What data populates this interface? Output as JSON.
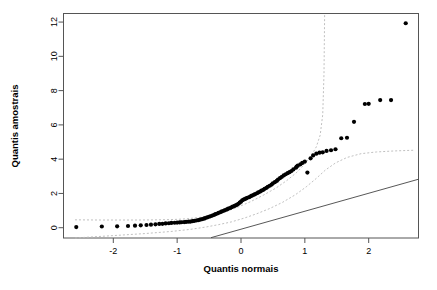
{
  "chart_data": {
    "type": "scatter",
    "title": "",
    "xlabel": "Quantis normais",
    "ylabel": "Quantis amostrais",
    "xlim": [
      -2.78,
      2.78
    ],
    "ylim": [
      -0.6,
      12.5
    ],
    "xticks": [
      -2,
      -1,
      0,
      1,
      2
    ],
    "xticklabels": [
      "-2",
      "-1",
      "0",
      "1",
      "2"
    ],
    "yticks": [
      0,
      2,
      4,
      6,
      8,
      10,
      12
    ],
    "yticklabels": [
      "0",
      "2",
      "4",
      "6",
      "8",
      "10",
      "12"
    ],
    "grid": false,
    "legend": "none",
    "series": [
      {
        "name": "Quantis amostrais (pontos)",
        "marker": "filled-circle",
        "color": "#000000",
        "points": [
          [
            -2.58,
            0.04
          ],
          [
            -2.18,
            0.07
          ],
          [
            -1.94,
            0.08
          ],
          [
            -1.77,
            0.1
          ],
          [
            -1.66,
            0.12
          ],
          [
            -1.57,
            0.14
          ],
          [
            -1.48,
            0.16
          ],
          [
            -1.41,
            0.18
          ],
          [
            -1.34,
            0.2
          ],
          [
            -1.28,
            0.22
          ],
          [
            -1.23,
            0.23
          ],
          [
            -1.18,
            0.25
          ],
          [
            -1.13,
            0.26
          ],
          [
            -1.09,
            0.28
          ],
          [
            -1.04,
            0.29
          ],
          [
            -1.0,
            0.3
          ],
          [
            -0.96,
            0.31
          ],
          [
            -0.93,
            0.32
          ],
          [
            -0.89,
            0.33
          ],
          [
            -0.86,
            0.34
          ],
          [
            -0.82,
            0.35
          ],
          [
            -0.79,
            0.36
          ],
          [
            -0.76,
            0.38
          ],
          [
            -0.73,
            0.4
          ],
          [
            -0.7,
            0.42
          ],
          [
            -0.67,
            0.44
          ],
          [
            -0.64,
            0.47
          ],
          [
            -0.61,
            0.5
          ],
          [
            -0.58,
            0.53
          ],
          [
            -0.56,
            0.56
          ],
          [
            -0.53,
            0.6
          ],
          [
            -0.5,
            0.64
          ],
          [
            -0.48,
            0.67
          ],
          [
            -0.45,
            0.71
          ],
          [
            -0.42,
            0.75
          ],
          [
            -0.4,
            0.79
          ],
          [
            -0.37,
            0.83
          ],
          [
            -0.35,
            0.87
          ],
          [
            -0.32,
            0.91
          ],
          [
            -0.3,
            0.95
          ],
          [
            -0.27,
            0.99
          ],
          [
            -0.25,
            1.03
          ],
          [
            -0.22,
            1.07
          ],
          [
            -0.2,
            1.11
          ],
          [
            -0.17,
            1.15
          ],
          [
            -0.15,
            1.19
          ],
          [
            -0.13,
            1.23
          ],
          [
            -0.1,
            1.27
          ],
          [
            -0.08,
            1.31
          ],
          [
            -0.06,
            1.35
          ],
          [
            -0.04,
            1.4
          ],
          [
            -0.02,
            1.46
          ],
          [
            0.0,
            1.52
          ],
          [
            0.02,
            1.6
          ],
          [
            0.04,
            1.64
          ],
          [
            0.06,
            1.67
          ],
          [
            0.08,
            1.71
          ],
          [
            0.1,
            1.75
          ],
          [
            0.13,
            1.79
          ],
          [
            0.15,
            1.83
          ],
          [
            0.17,
            1.87
          ],
          [
            0.2,
            1.92
          ],
          [
            0.22,
            1.96
          ],
          [
            0.25,
            2.01
          ],
          [
            0.27,
            2.06
          ],
          [
            0.3,
            2.11
          ],
          [
            0.32,
            2.16
          ],
          [
            0.35,
            2.21
          ],
          [
            0.37,
            2.27
          ],
          [
            0.4,
            2.33
          ],
          [
            0.42,
            2.39
          ],
          [
            0.45,
            2.45
          ],
          [
            0.48,
            2.52
          ],
          [
            0.5,
            2.59
          ],
          [
            0.53,
            2.66
          ],
          [
            0.56,
            2.73
          ],
          [
            0.58,
            2.81
          ],
          [
            0.61,
            2.89
          ],
          [
            0.64,
            2.97
          ],
          [
            0.67,
            3.05
          ],
          [
            0.7,
            3.12
          ],
          [
            0.73,
            3.18
          ],
          [
            0.76,
            3.24
          ],
          [
            0.79,
            3.31
          ],
          [
            0.82,
            3.4
          ],
          [
            0.86,
            3.5
          ],
          [
            0.87,
            3.56
          ],
          [
            0.89,
            3.62
          ],
          [
            0.93,
            3.7
          ],
          [
            0.96,
            3.78
          ],
          [
            1.0,
            3.86
          ],
          [
            1.04,
            3.22
          ],
          [
            1.09,
            4.05
          ],
          [
            1.13,
            4.22
          ],
          [
            1.18,
            4.32
          ],
          [
            1.23,
            4.38
          ],
          [
            1.28,
            4.4
          ],
          [
            1.34,
            4.48
          ],
          [
            1.41,
            4.52
          ],
          [
            1.48,
            4.58
          ],
          [
            1.57,
            5.22
          ],
          [
            1.66,
            5.25
          ],
          [
            1.77,
            6.18
          ],
          [
            1.94,
            7.22
          ],
          [
            2.0,
            7.23
          ],
          [
            2.18,
            7.45
          ],
          [
            2.35,
            7.45
          ],
          [
            2.58,
            11.93
          ]
        ]
      }
    ],
    "reference_line": {
      "name": "linha de referencia",
      "style": "solid",
      "color": "#444444",
      "from": [
        -0.47,
        -0.58
      ],
      "to": [
        2.78,
        2.83
      ]
    },
    "confidence_bands": [
      {
        "name": "banda superior",
        "style": "dashed",
        "color": "#b9b9b9",
        "points": [
          [
            -2.6,
            0.46
          ],
          [
            -2.2,
            0.45
          ],
          [
            -1.9,
            0.45
          ],
          [
            -1.6,
            0.45
          ],
          [
            -1.3,
            0.46
          ],
          [
            -1.05,
            0.48
          ],
          [
            -0.85,
            0.52
          ],
          [
            -0.65,
            0.6
          ],
          [
            -0.45,
            0.72
          ],
          [
            -0.25,
            0.92
          ],
          [
            -0.05,
            1.2
          ],
          [
            0.15,
            1.52
          ],
          [
            0.35,
            1.9
          ],
          [
            0.55,
            2.32
          ],
          [
            0.72,
            2.76
          ],
          [
            0.88,
            3.25
          ],
          [
            1.0,
            3.72
          ],
          [
            1.1,
            4.2
          ],
          [
            1.18,
            4.72
          ],
          [
            1.24,
            5.4
          ],
          [
            1.28,
            6.6
          ],
          [
            1.3,
            9.0
          ],
          [
            1.31,
            12.5
          ]
        ]
      },
      {
        "name": "banda inferior",
        "style": "dashed",
        "color": "#b9b9b9",
        "points": [
          [
            -2.6,
            -0.6
          ],
          [
            -2.0,
            -0.46
          ],
          [
            -1.5,
            -0.34
          ],
          [
            -1.1,
            -0.22
          ],
          [
            -0.8,
            -0.1
          ],
          [
            -0.55,
            0.04
          ],
          [
            -0.35,
            0.18
          ],
          [
            -0.15,
            0.34
          ],
          [
            0.05,
            0.56
          ],
          [
            0.25,
            0.82
          ],
          [
            0.45,
            1.12
          ],
          [
            0.65,
            1.48
          ],
          [
            0.85,
            1.92
          ],
          [
            1.02,
            2.38
          ],
          [
            1.18,
            2.88
          ],
          [
            1.32,
            3.36
          ],
          [
            1.48,
            3.78
          ],
          [
            1.66,
            4.1
          ],
          [
            1.88,
            4.32
          ],
          [
            2.12,
            4.42
          ],
          [
            2.4,
            4.48
          ],
          [
            2.7,
            4.52
          ]
        ]
      }
    ]
  },
  "axes": {
    "x_title": "Quantis normais",
    "y_title": "Quantis amostrais"
  }
}
